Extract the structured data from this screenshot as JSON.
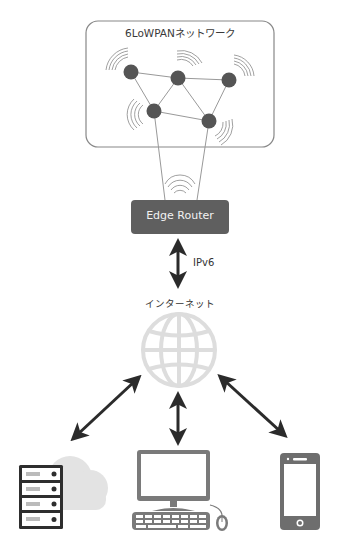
{
  "diagram": {
    "network_box": {
      "title": "6LoWPANネットワーク",
      "nodes": [
        {
          "id": "n1",
          "x": 131,
          "y": 72
        },
        {
          "id": "n2",
          "x": 178,
          "y": 78
        },
        {
          "id": "n3",
          "x": 229,
          "y": 80
        },
        {
          "id": "n4",
          "x": 154,
          "y": 111
        },
        {
          "id": "n5",
          "x": 209,
          "y": 121
        }
      ],
      "links": [
        [
          "n1",
          "n2"
        ],
        [
          "n2",
          "n3"
        ],
        [
          "n1",
          "n4"
        ],
        [
          "n2",
          "n4"
        ],
        [
          "n2",
          "n5"
        ],
        [
          "n3",
          "n5"
        ],
        [
          "n4",
          "n5"
        ]
      ]
    },
    "router": {
      "label": "Edge Router"
    },
    "link_protocol": "IPv6",
    "internet": {
      "label": "インターネット"
    },
    "endpoints": [
      {
        "name": "cloud-server"
      },
      {
        "name": "desktop-pc"
      },
      {
        "name": "smartphone"
      }
    ],
    "colors": {
      "node": "#555555",
      "line": "#999999",
      "router_fill": "#5f5f5f",
      "arrow": "#2b2b2b",
      "globe": "#dddddd",
      "device": "#6e6e6e",
      "cloud": "#e3e3e3",
      "box_border": "#888888"
    }
  }
}
